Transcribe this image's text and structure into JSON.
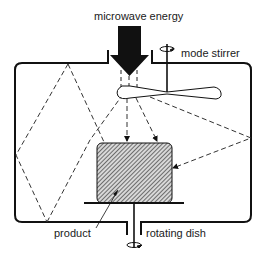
{
  "diagram": {
    "labels": {
      "energy": "microwave energy",
      "stirrer": "mode stirrer",
      "product": "product",
      "dish": "rotating dish"
    },
    "colors": {
      "stroke": "#111111",
      "hatch_fill": "#9a9a9a",
      "background": "#ffffff"
    },
    "components": [
      {
        "id": "waveguide",
        "label": "microwave energy"
      },
      {
        "id": "cavity",
        "label": ""
      },
      {
        "id": "mode-stirrer",
        "label": "mode stirrer"
      },
      {
        "id": "product",
        "label": "product"
      },
      {
        "id": "rotating-dish",
        "label": "rotating dish"
      }
    ]
  }
}
